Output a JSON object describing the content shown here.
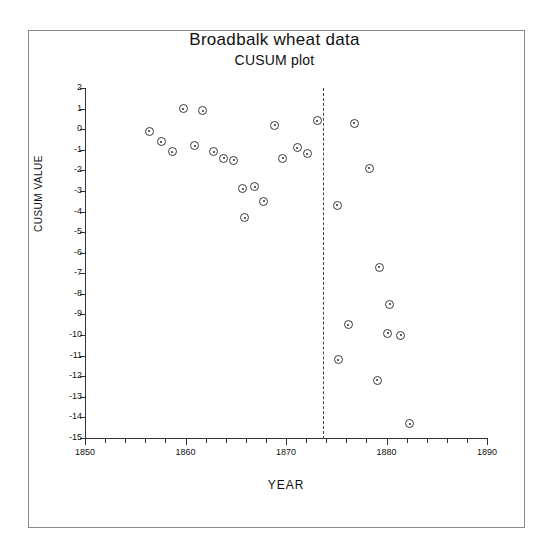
{
  "figure": {
    "title": "Broadbalk wheat data",
    "subtitle": "CUSUM plot"
  },
  "chart_data": {
    "type": "scatter",
    "title": "Broadbalk wheat data",
    "subtitle": "CUSUM plot",
    "xlabel": "YEAR",
    "ylabel": "CUSUM VALUE",
    "xlim": [
      1850,
      1890
    ],
    "ylim": [
      -15,
      2
    ],
    "grid": false,
    "legend": null,
    "x_ticks_major": [
      1850,
      1860,
      1870,
      1880,
      1890
    ],
    "x_tick_labels": [
      "1850",
      "1860",
      "1870",
      "1880",
      "1890"
    ],
    "x_tick_minor_step": 2,
    "y_ticks": [
      2,
      1,
      0,
      -1,
      -2,
      -3,
      -4,
      -5,
      -6,
      -7,
      -8,
      -9,
      -10,
      -11,
      -12,
      -13,
      -14,
      -15
    ],
    "y_tick_labels": [
      "2",
      "1",
      "0",
      "-1",
      "-2",
      "-3",
      "-4",
      "-5",
      "-6",
      "-7",
      "-8",
      "-9",
      "-10",
      "-11",
      "-12",
      "-13",
      "-14",
      "-15"
    ],
    "annotations": [
      {
        "type": "vertical-dashed-line",
        "name": "change-point-line",
        "x": 1873.7,
        "style": "dashed"
      }
    ],
    "points": [
      {
        "x": 1856.4,
        "y": -0.1
      },
      {
        "x": 1857.6,
        "y": -0.6
      },
      {
        "x": 1858.7,
        "y": -1.1
      },
      {
        "x": 1859.8,
        "y": 1.0
      },
      {
        "x": 1861.7,
        "y": 0.9
      },
      {
        "x": 1860.9,
        "y": -0.8
      },
      {
        "x": 1862.8,
        "y": -1.1
      },
      {
        "x": 1863.8,
        "y": -1.4
      },
      {
        "x": 1864.8,
        "y": -1.5
      },
      {
        "x": 1865.7,
        "y": -2.9
      },
      {
        "x": 1866.9,
        "y": -2.8
      },
      {
        "x": 1865.9,
        "y": -4.3
      },
      {
        "x": 1867.8,
        "y": -3.5
      },
      {
        "x": 1869.7,
        "y": -1.4
      },
      {
        "x": 1868.9,
        "y": 0.2
      },
      {
        "x": 1871.1,
        "y": -0.9
      },
      {
        "x": 1872.1,
        "y": -1.2
      },
      {
        "x": 1873.1,
        "y": 0.4
      },
      {
        "x": 1876.8,
        "y": 0.3
      },
      {
        "x": 1875.1,
        "y": -3.7
      },
      {
        "x": 1878.3,
        "y": -1.9
      },
      {
        "x": 1879.3,
        "y": -6.7
      },
      {
        "x": 1880.3,
        "y": -8.5
      },
      {
        "x": 1881.4,
        "y": -10.0
      },
      {
        "x": 1876.2,
        "y": -9.5
      },
      {
        "x": 1875.2,
        "y": -11.2
      },
      {
        "x": 1880.1,
        "y": -9.9
      },
      {
        "x": 1879.1,
        "y": -12.2
      },
      {
        "x": 1882.3,
        "y": -14.3
      }
    ]
  }
}
